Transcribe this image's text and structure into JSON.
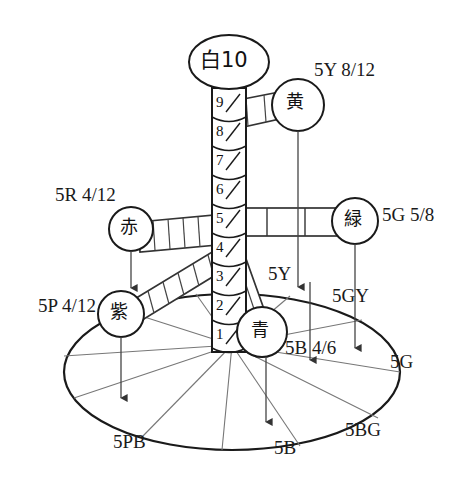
{
  "diagram": {
    "type": "munsell-color-tree"
  },
  "axis": {
    "name": "value-scale-column",
    "top_label": "白10",
    "steps": [
      "9",
      "8",
      "7",
      "6",
      "5",
      "4",
      "3",
      "2",
      "1"
    ],
    "slash": "/"
  },
  "color_nodes": [
    {
      "id": "white",
      "jp": "白10",
      "notation": "",
      "bar_segments": 0
    },
    {
      "id": "yellow",
      "jp": "黄",
      "notation_prefix": "5Y",
      "notation_num": "8",
      "notation_den": "12",
      "bar_segments": 4
    },
    {
      "id": "red",
      "jp": "赤",
      "notation_prefix": "5R",
      "notation_num": "4",
      "notation_den": "12",
      "bar_segments": 6
    },
    {
      "id": "purple",
      "jp": "紫",
      "notation_prefix": "5P",
      "notation_num": "4",
      "notation_den": "12",
      "bar_segments": 6
    },
    {
      "id": "green",
      "jp": "緑",
      "notation_prefix": "5G",
      "notation_num": "5",
      "notation_den": "8",
      "bar_segments": 3
    },
    {
      "id": "blue",
      "jp": "青",
      "notation_prefix": "5B",
      "notation_num": "4",
      "notation_den": "6",
      "bar_segments": 2
    }
  ],
  "chroma_labels": {
    "yellow": "5Y 8/12",
    "red": "5R 4/12",
    "purple": "5P 4/12",
    "green": "5G 5/8",
    "blue": "5B 4/6"
  },
  "hue_labels": [
    {
      "id": "5Y",
      "text": "5Y"
    },
    {
      "id": "5GY",
      "text": "5GY"
    },
    {
      "id": "5G",
      "text": "5G"
    },
    {
      "id": "5BG",
      "text": "5BG"
    },
    {
      "id": "5B",
      "text": "5B"
    },
    {
      "id": "5PB",
      "text": "5PB"
    }
  ],
  "colors": {
    "ink": "#1a1a1a",
    "line": "#333333",
    "thin": "#666666",
    "paper": "#ffffff"
  }
}
